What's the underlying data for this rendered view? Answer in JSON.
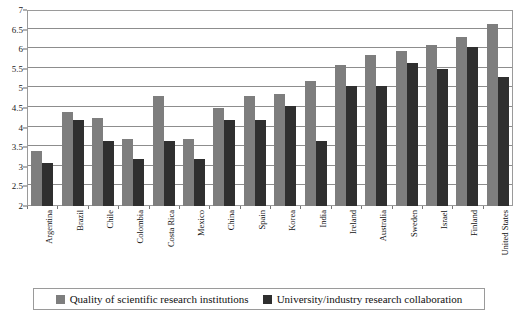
{
  "chart_data": {
    "type": "bar",
    "title": "",
    "xlabel": "",
    "ylabel": "",
    "ylim": [
      2,
      7
    ],
    "yticks": [
      2,
      2.5,
      3,
      3.5,
      4,
      4.5,
      5,
      5.5,
      6,
      6.5,
      7
    ],
    "ytick_labels": [
      "2",
      "2.5",
      "3",
      "3.5",
      "4",
      "4.5",
      "5",
      "5.5",
      "6",
      "6.5",
      "7"
    ],
    "grid": true,
    "legend_position": "bottom",
    "categories": [
      "Argentina",
      "Brazil",
      "Chile",
      "Colombia",
      "Costa Rica",
      "Mexico",
      "China",
      "Spain",
      "Korea",
      "India",
      "Ireland",
      "Australia",
      "Sweden",
      "Israel",
      "Finland",
      "United States"
    ],
    "series": [
      {
        "name": "Quality of scientific research institutions",
        "color": "#7e7e7e",
        "values": [
          3.4,
          4.4,
          4.25,
          3.7,
          4.8,
          3.7,
          4.5,
          4.8,
          4.85,
          5.2,
          5.6,
          5.85,
          5.95,
          6.1,
          6.3,
          6.65
        ]
      },
      {
        "name": "University/industry research collaboration",
        "color": "#2f2f2f",
        "values": [
          3.1,
          4.2,
          3.65,
          3.2,
          3.65,
          3.2,
          4.2,
          4.2,
          4.55,
          3.65,
          5.05,
          5.05,
          5.65,
          5.5,
          6.05,
          5.3
        ]
      }
    ]
  },
  "legend": {
    "items": [
      {
        "label": "Quality of scientific research institutions",
        "swatch": "light"
      },
      {
        "label": "University/industry research collaboration",
        "swatch": "dark"
      }
    ]
  }
}
